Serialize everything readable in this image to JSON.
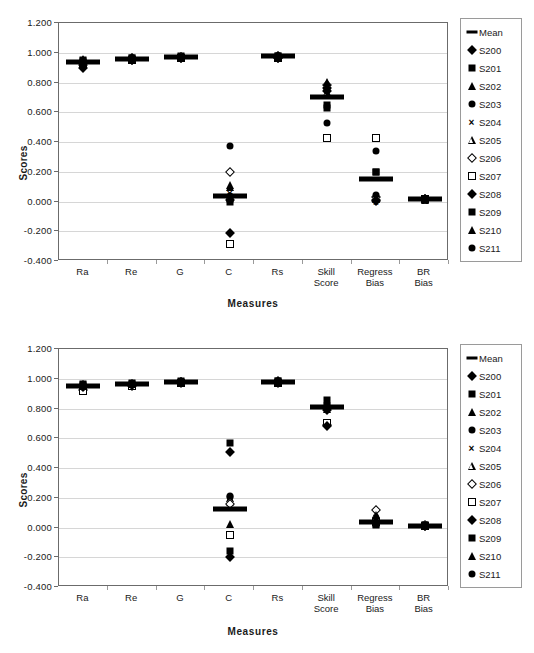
{
  "chart_data": [
    {
      "id": "top",
      "type": "scatter",
      "title": "",
      "xlabel": "Measures",
      "ylabel": "Scores",
      "categories": [
        "Ra",
        "Re",
        "G",
        "C",
        "Rs",
        "Skill\nScore",
        "Regress\nBias",
        "BR Bias"
      ],
      "ylim": [
        -0.4,
        1.2
      ],
      "yticks": [
        "1.200",
        "1.000",
        "0.800",
        "0.600",
        "0.400",
        "0.200",
        "0.000",
        "-0.200",
        "-0.400"
      ],
      "ytick_values": [
        1.2,
        1.0,
        0.8,
        0.6,
        0.4,
        0.2,
        0.0,
        -0.2,
        -0.4
      ],
      "grid": true,
      "legend_position": "right",
      "series": [
        {
          "name": "Mean",
          "marker": "mean",
          "values": [
            0.935,
            0.96,
            0.97,
            0.035,
            0.975,
            0.7,
            0.15,
            0.015
          ]
        },
        {
          "name": "S200",
          "marker": "diamond",
          "values": [
            0.945,
            0.965,
            0.972,
            0.01,
            0.978,
            0.76,
            0.01,
            0.015
          ]
        },
        {
          "name": "S201",
          "marker": "square",
          "values": [
            0.95,
            0.968,
            0.975,
            0.02,
            0.98,
            0.63,
            0.195,
            0.018
          ]
        },
        {
          "name": "S202",
          "marker": "triangle",
          "values": [
            0.955,
            0.97,
            0.978,
            0.11,
            0.982,
            0.8,
            0.025,
            0.016
          ]
        },
        {
          "name": "S203",
          "marker": "circle",
          "values": [
            0.94,
            0.962,
            0.97,
            0.375,
            0.975,
            0.525,
            0.34,
            0.014
          ]
        },
        {
          "name": "S204",
          "marker": "cross",
          "values": [
            0.93,
            0.958,
            0.968,
            0.06,
            0.972,
            0.745,
            0.0,
            0.012
          ]
        },
        {
          "name": "S205",
          "marker": "opentri",
          "values": [
            0.925,
            0.955,
            0.965,
            0.03,
            0.97,
            0.735,
            0.02,
            0.013
          ]
        },
        {
          "name": "S206",
          "marker": "opendia",
          "values": [
            0.92,
            0.952,
            0.966,
            0.195,
            0.968,
            0.785,
            0.03,
            0.015
          ]
        },
        {
          "name": "S207",
          "marker": "opensqr",
          "values": [
            0.915,
            0.95,
            0.963,
            -0.285,
            0.966,
            0.425,
            0.425,
            0.017
          ]
        },
        {
          "name": "S208",
          "marker": "diamond",
          "values": [
            0.9,
            0.948,
            0.964,
            -0.21,
            0.965,
            0.745,
            0.005,
            0.014
          ]
        },
        {
          "name": "S209",
          "marker": "square",
          "values": [
            0.945,
            0.966,
            0.973,
            0.0,
            0.977,
            0.65,
            0.2,
            0.016
          ]
        },
        {
          "name": "S210",
          "marker": "triangle",
          "values": [
            0.938,
            0.96,
            0.969,
            0.095,
            0.974,
            0.805,
            0.022,
            0.015
          ]
        },
        {
          "name": "S211",
          "marker": "circle",
          "values": [
            0.942,
            0.963,
            0.971,
            0.04,
            0.976,
            0.755,
            0.045,
            0.013
          ]
        }
      ]
    },
    {
      "id": "bottom",
      "type": "scatter",
      "title": "",
      "xlabel": "Measures",
      "ylabel": "Scores",
      "categories": [
        "Ra",
        "Re",
        "G",
        "C",
        "Rs",
        "Skill\nScore",
        "Regress\nBias",
        "BR Bias"
      ],
      "ylim": [
        -0.4,
        1.2
      ],
      "yticks": [
        "1.200",
        "1.000",
        "0.800",
        "0.600",
        "0.400",
        "0.200",
        "0.000",
        "-0.200",
        "-0.400"
      ],
      "ytick_values": [
        1.2,
        1.0,
        0.8,
        0.6,
        0.4,
        0.2,
        0.0,
        -0.2,
        -0.4
      ],
      "grid": true,
      "legend_position": "right",
      "series": [
        {
          "name": "Mean",
          "marker": "mean",
          "values": [
            0.95,
            0.965,
            0.978,
            0.125,
            0.98,
            0.81,
            0.035,
            0.012
          ]
        },
        {
          "name": "S200",
          "marker": "diamond",
          "values": [
            0.96,
            0.968,
            0.98,
            0.505,
            0.982,
            0.79,
            0.03,
            0.014
          ]
        },
        {
          "name": "S201",
          "marker": "square",
          "values": [
            0.965,
            0.972,
            0.983,
            0.565,
            0.985,
            0.855,
            0.02,
            0.015
          ]
        },
        {
          "name": "S202",
          "marker": "triangle",
          "values": [
            0.955,
            0.966,
            0.979,
            0.195,
            0.981,
            0.8,
            0.085,
            0.013
          ]
        },
        {
          "name": "S203",
          "marker": "circle",
          "values": [
            0.948,
            0.963,
            0.977,
            0.205,
            0.979,
            0.815,
            0.032,
            0.012
          ]
        },
        {
          "name": "S204",
          "marker": "cross",
          "values": [
            0.935,
            0.958,
            0.975,
            0.185,
            0.977,
            0.805,
            0.028,
            0.011
          ]
        },
        {
          "name": "S205",
          "marker": "opentri",
          "values": [
            0.93,
            0.956,
            0.974,
            0.17,
            0.976,
            0.808,
            0.09,
            0.012
          ]
        },
        {
          "name": "S206",
          "marker": "opendia",
          "values": [
            0.925,
            0.954,
            0.972,
            0.16,
            0.974,
            0.69,
            0.12,
            0.013
          ]
        },
        {
          "name": "S207",
          "marker": "opensqr",
          "values": [
            0.918,
            0.951,
            0.97,
            -0.05,
            0.972,
            0.7,
            0.04,
            0.01
          ]
        },
        {
          "name": "S208",
          "marker": "diamond",
          "values": [
            0.945,
            0.96,
            0.976,
            -0.195,
            0.978,
            0.68,
            0.036,
            0.012
          ]
        },
        {
          "name": "S209",
          "marker": "square",
          "values": [
            0.958,
            0.967,
            0.981,
            -0.16,
            0.983,
            0.82,
            0.025,
            0.014
          ]
        },
        {
          "name": "S210",
          "marker": "triangle",
          "values": [
            0.952,
            0.964,
            0.978,
            0.025,
            0.98,
            0.812,
            0.082,
            0.013
          ]
        },
        {
          "name": "S211",
          "marker": "circle",
          "values": [
            0.942,
            0.961,
            0.976,
            0.21,
            0.979,
            0.806,
            0.038,
            0.011
          ]
        }
      ]
    }
  ],
  "legend": {
    "items": [
      {
        "label": "Mean",
        "marker": "mean"
      },
      {
        "label": "S200",
        "marker": "diamond"
      },
      {
        "label": "S201",
        "marker": "square"
      },
      {
        "label": "S202",
        "marker": "triangle"
      },
      {
        "label": "S203",
        "marker": "circle"
      },
      {
        "label": "S204",
        "marker": "cross"
      },
      {
        "label": "S205",
        "marker": "opentri"
      },
      {
        "label": "S206",
        "marker": "opendia"
      },
      {
        "label": "S207",
        "marker": "opensqr"
      },
      {
        "label": "S208",
        "marker": "diamond"
      },
      {
        "label": "S209",
        "marker": "square"
      },
      {
        "label": "S210",
        "marker": "triangle"
      },
      {
        "label": "S211",
        "marker": "circle"
      }
    ]
  },
  "colors": {
    "marker": "#000000",
    "grid": "#d6d6d6",
    "frame": "#6b6b6b",
    "text": "#1a1a1a",
    "background": "#ffffff"
  }
}
